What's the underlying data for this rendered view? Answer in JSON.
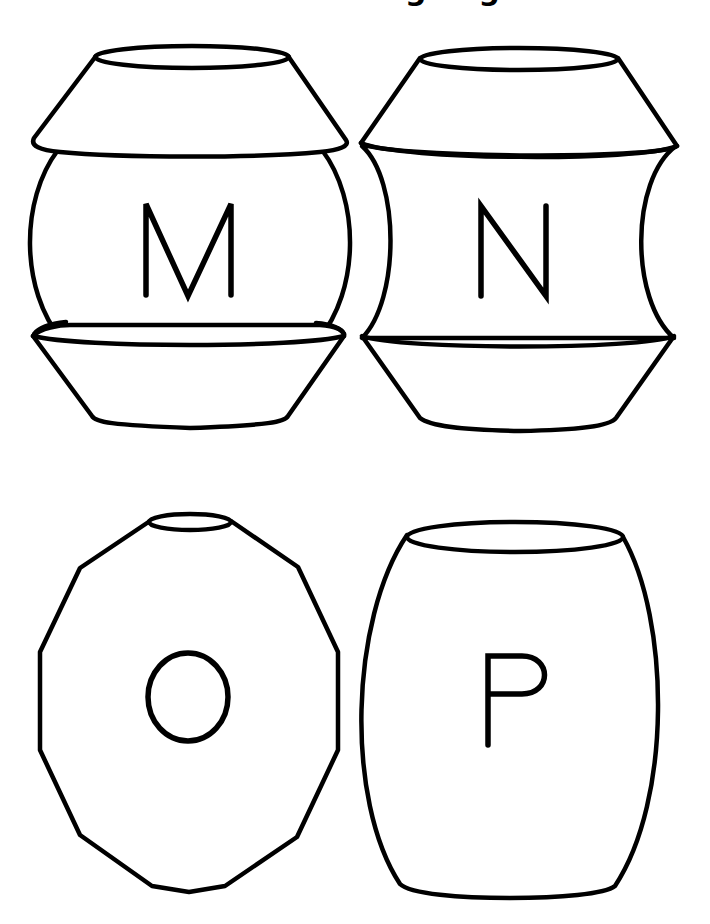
{
  "page": {
    "title": "Bead Coloring Page",
    "background_color": "#ffffff",
    "line_color": "#000000"
  },
  "beads": [
    {
      "letter": "M",
      "shape": "round bead with top cone and bottom bowl cap"
    },
    {
      "letter": "N",
      "shape": "spool bead with concave middle"
    },
    {
      "letter": "O",
      "shape": "faceted polygon bead"
    },
    {
      "letter": "P",
      "shape": "barrel bead"
    }
  ]
}
